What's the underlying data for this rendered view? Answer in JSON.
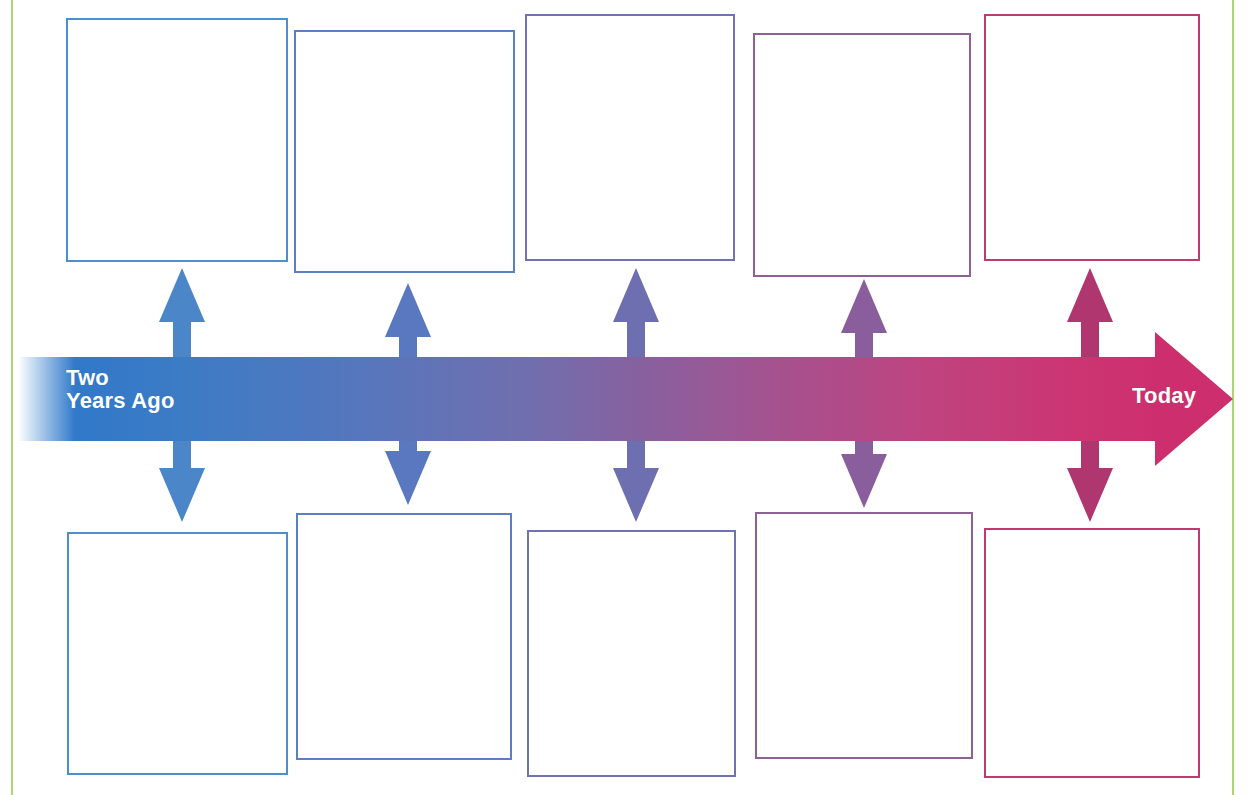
{
  "worksheet": {
    "title": "Two Years Ago to Today Timeline",
    "background_color": "#ffffff",
    "page_rule_color": "#a8d46a"
  },
  "timeline": {
    "start_label": "Two\nYears Ago",
    "end_label": "Today",
    "direction": "left-to-right",
    "start_color": "#3179c9",
    "end_color": "#cd2f6e",
    "label_color": "#ffffff"
  },
  "connectors": [
    {
      "name": "connector-1",
      "color": "#4a86c8",
      "center_x": 182,
      "top": 268,
      "bottom": 522
    },
    {
      "name": "connector-2",
      "color": "#5978bf",
      "center_x": 408,
      "top": 283,
      "bottom": 505
    },
    {
      "name": "connector-3",
      "color": "#6e6fb0",
      "center_x": 636,
      "top": 268,
      "bottom": 522
    },
    {
      "name": "connector-4",
      "color": "#8a5e9c",
      "center_x": 864,
      "top": 279,
      "bottom": 508
    },
    {
      "name": "connector-5",
      "color": "#b0366f",
      "center_x": 1090,
      "top": 268,
      "bottom": 522
    }
  ],
  "top_boxes": [
    {
      "label": "top-box-1",
      "border_color": "#4a90d0",
      "x": 66,
      "y": 18,
      "w": 222,
      "h": 244
    },
    {
      "label": "top-box-2",
      "border_color": "#5b7fc4",
      "x": 294,
      "y": 30,
      "w": 221,
      "h": 243
    },
    {
      "label": "top-box-3",
      "border_color": "#6f73b4",
      "x": 525,
      "y": 14,
      "w": 210,
      "h": 247
    },
    {
      "label": "top-box-4",
      "border_color": "#8e6195",
      "x": 753,
      "y": 33,
      "w": 218,
      "h": 244
    },
    {
      "label": "top-box-5",
      "border_color": "#c03a72",
      "x": 984,
      "y": 14,
      "w": 216,
      "h": 247
    }
  ],
  "bottom_boxes": [
    {
      "label": "bottom-box-1",
      "border_color": "#4a90d0",
      "x": 67,
      "y": 532,
      "w": 221,
      "h": 243
    },
    {
      "label": "bottom-box-2",
      "border_color": "#5b7fc4",
      "x": 296,
      "y": 513,
      "w": 216,
      "h": 247
    },
    {
      "label": "bottom-box-3",
      "border_color": "#6f73b4",
      "x": 527,
      "y": 530,
      "w": 209,
      "h": 247
    },
    {
      "label": "bottom-box-4",
      "border_color": "#8e6195",
      "x": 755,
      "y": 512,
      "w": 218,
      "h": 247
    },
    {
      "label": "bottom-box-5",
      "border_color": "#c03a72",
      "x": 984,
      "y": 528,
      "w": 216,
      "h": 250
    }
  ]
}
